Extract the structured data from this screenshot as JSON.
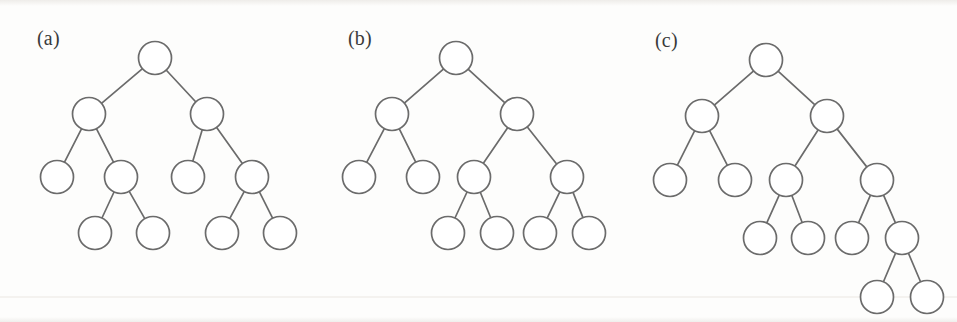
{
  "figure": {
    "width": 957,
    "height": 322,
    "background_color": "#fdfdfc",
    "stroke_color": "#6b6b6b",
    "node_fill_color": "#ffffff",
    "label_color": "#3a3a3a",
    "node_radius": 16.5,
    "edge_width": 1.7
  },
  "panels": [
    {
      "id": "a",
      "label": "(a)",
      "label_x": 37,
      "label_y": 28,
      "node_count": 11,
      "depth": 4,
      "description": "balanced binary tree, four levels",
      "nodes": [
        {
          "id": "a0",
          "x": 155,
          "y": 58,
          "level": 0
        },
        {
          "id": "a1",
          "x": 89,
          "y": 114,
          "level": 1
        },
        {
          "id": "a2",
          "x": 207,
          "y": 114,
          "level": 1
        },
        {
          "id": "a3",
          "x": 57,
          "y": 177,
          "level": 2
        },
        {
          "id": "a4",
          "x": 121,
          "y": 177,
          "level": 2
        },
        {
          "id": "a5",
          "x": 188,
          "y": 177,
          "level": 2
        },
        {
          "id": "a6",
          "x": 252,
          "y": 177,
          "level": 2
        },
        {
          "id": "a7",
          "x": 95,
          "y": 233,
          "level": 3
        },
        {
          "id": "a8",
          "x": 153,
          "y": 233,
          "level": 3
        },
        {
          "id": "a9",
          "x": 222,
          "y": 233,
          "level": 3
        },
        {
          "id": "a10",
          "x": 280,
          "y": 233,
          "level": 3
        }
      ],
      "edges": [
        [
          "a0",
          "a1"
        ],
        [
          "a0",
          "a2"
        ],
        [
          "a1",
          "a3"
        ],
        [
          "a1",
          "a4"
        ],
        [
          "a2",
          "a5"
        ],
        [
          "a2",
          "a6"
        ],
        [
          "a4",
          "a7"
        ],
        [
          "a4",
          "a8"
        ],
        [
          "a6",
          "a9"
        ],
        [
          "a6",
          "a10"
        ]
      ]
    },
    {
      "id": "b",
      "label": "(b)",
      "label_x": 348,
      "label_y": 28,
      "node_count": 11,
      "depth": 4,
      "description": "binary tree with deeper right subtree",
      "nodes": [
        {
          "id": "b0",
          "x": 456,
          "y": 58,
          "level": 0
        },
        {
          "id": "b1",
          "x": 392,
          "y": 114,
          "level": 1
        },
        {
          "id": "b2",
          "x": 517,
          "y": 114,
          "level": 1
        },
        {
          "id": "b3",
          "x": 359,
          "y": 177,
          "level": 2
        },
        {
          "id": "b4",
          "x": 423,
          "y": 177,
          "level": 2
        },
        {
          "id": "b5",
          "x": 474,
          "y": 177,
          "level": 2
        },
        {
          "id": "b6",
          "x": 567,
          "y": 177,
          "level": 2
        },
        {
          "id": "b7",
          "x": 448,
          "y": 233,
          "level": 3
        },
        {
          "id": "b8",
          "x": 497,
          "y": 233,
          "level": 3
        },
        {
          "id": "b9",
          "x": 540,
          "y": 233,
          "level": 3
        },
        {
          "id": "b10",
          "x": 589,
          "y": 233,
          "level": 3
        }
      ],
      "edges": [
        [
          "b0",
          "b1"
        ],
        [
          "b0",
          "b2"
        ],
        [
          "b1",
          "b3"
        ],
        [
          "b1",
          "b4"
        ],
        [
          "b2",
          "b5"
        ],
        [
          "b2",
          "b6"
        ],
        [
          "b5",
          "b7"
        ],
        [
          "b5",
          "b8"
        ],
        [
          "b6",
          "b9"
        ],
        [
          "b6",
          "b10"
        ]
      ]
    },
    {
      "id": "c",
      "label": "(c)",
      "label_x": 655,
      "label_y": 30,
      "node_count": 13,
      "depth": 5,
      "description": "binary tree with an extra fifth level on the rightmost branch",
      "nodes": [
        {
          "id": "c0",
          "x": 766,
          "y": 60,
          "level": 0
        },
        {
          "id": "c1",
          "x": 702,
          "y": 116,
          "level": 1
        },
        {
          "id": "c2",
          "x": 827,
          "y": 116,
          "level": 1
        },
        {
          "id": "c3",
          "x": 670,
          "y": 180,
          "level": 2
        },
        {
          "id": "c4",
          "x": 735,
          "y": 180,
          "level": 2
        },
        {
          "id": "c5",
          "x": 786,
          "y": 180,
          "level": 2
        },
        {
          "id": "c6",
          "x": 877,
          "y": 180,
          "level": 2
        },
        {
          "id": "c7",
          "x": 760,
          "y": 238,
          "level": 3
        },
        {
          "id": "c8",
          "x": 808,
          "y": 238,
          "level": 3
        },
        {
          "id": "c9",
          "x": 852,
          "y": 238,
          "level": 3
        },
        {
          "id": "c10",
          "x": 902,
          "y": 238,
          "level": 3
        },
        {
          "id": "c11",
          "x": 877,
          "y": 297,
          "level": 4
        },
        {
          "id": "c12",
          "x": 927,
          "y": 297,
          "level": 4
        }
      ],
      "edges": [
        [
          "c0",
          "c1"
        ],
        [
          "c0",
          "c2"
        ],
        [
          "c1",
          "c3"
        ],
        [
          "c1",
          "c4"
        ],
        [
          "c2",
          "c5"
        ],
        [
          "c2",
          "c6"
        ],
        [
          "c5",
          "c7"
        ],
        [
          "c5",
          "c8"
        ],
        [
          "c6",
          "c9"
        ],
        [
          "c6",
          "c10"
        ],
        [
          "c10",
          "c11"
        ],
        [
          "c10",
          "c12"
        ]
      ]
    }
  ]
}
